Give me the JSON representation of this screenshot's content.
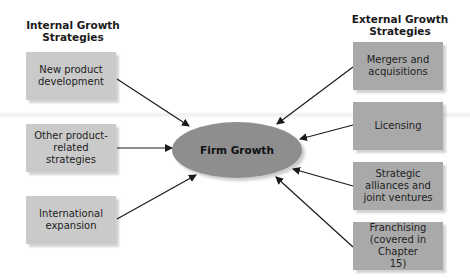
{
  "diagram": {
    "left_heading": "Internal Growth\nStrategies",
    "right_heading": "External Growth\nStrategies",
    "center": "Firm Growth",
    "internal": [
      {
        "label": "New product development"
      },
      {
        "label": "Other product-related strategies"
      },
      {
        "label": "International expansion"
      }
    ],
    "external": [
      {
        "label": "Mergers and acquisitions"
      },
      {
        "label": "Licensing"
      },
      {
        "label": "Strategic alliances and joint ventures"
      },
      {
        "label": "Franchising (covered in Chapter 15)"
      }
    ],
    "colors": {
      "internal_box": "#cacaca",
      "external_box": "#a9a9a9",
      "center_ellipse": "#8e8e8e",
      "arrow": "#1a1a1a"
    }
  }
}
